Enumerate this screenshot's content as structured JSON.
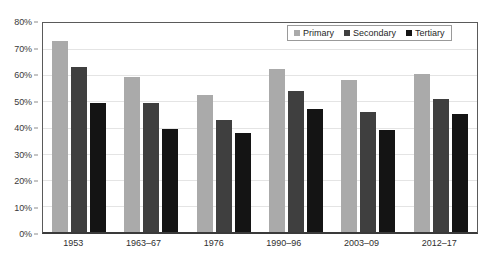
{
  "chart_data": {
    "type": "bar",
    "title": "",
    "subtitle": "",
    "xlabel": "",
    "ylabel": "",
    "categories": [
      "1953",
      "1963–67",
      "1976",
      "1990–96",
      "2003–09",
      "2012–17"
    ],
    "series": [
      {
        "name": "Primary",
        "color": "#aaaaaa",
        "values": [
          73,
          59.5,
          52.5,
          62.5,
          58,
          60.5
        ]
      },
      {
        "name": "Secondary",
        "color": "#3f3f3f",
        "values": [
          63,
          49.5,
          43,
          54,
          46,
          51
        ]
      },
      {
        "name": "Tertiary",
        "color": "#141414",
        "values": [
          49.5,
          39.5,
          38,
          47,
          39,
          45
        ]
      }
    ],
    "ylim": [
      0,
      80
    ],
    "y_ticks": [
      0,
      10,
      20,
      30,
      40,
      50,
      60,
      70,
      80
    ],
    "y_tick_labels": [
      "0%",
      "10%",
      "20%",
      "30%",
      "40%",
      "50%",
      "60%",
      "70%",
      "80%"
    ],
    "grid": true,
    "legend_position": "top-right"
  },
  "legend": {
    "items": [
      {
        "label": "Primary"
      },
      {
        "label": "Secondary"
      },
      {
        "label": "Tertiary"
      }
    ]
  },
  "colors": {
    "primary": "#aaaaaa",
    "secondary": "#3f3f3f",
    "tertiary": "#141414",
    "axis": "#3a3a3a",
    "gridline": "#e4e4e4",
    "background": "#ffffff"
  }
}
